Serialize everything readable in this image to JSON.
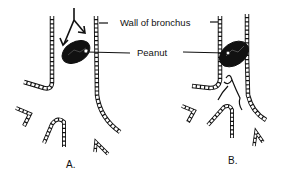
{
  "diagram": {
    "labels": {
      "wall": "Wall of bronchus",
      "peanut": "Peanut"
    },
    "panels": [
      {
        "id": "A",
        "caption": "A.",
        "description": "Peanut in bronchus with airflow arrows around it"
      },
      {
        "id": "B",
        "caption": "B.",
        "description": "Peanut blocking bronchus with valve-like flap below"
      }
    ],
    "colors": {
      "ink": "#111111",
      "background": "#ffffff"
    }
  }
}
